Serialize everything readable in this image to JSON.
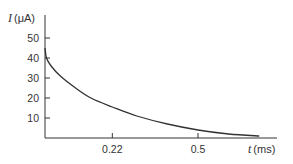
{
  "chart_data": {
    "type": "line",
    "title": "",
    "xlabel": "t (ms)",
    "ylabel": "I (μA)",
    "xlabel_var": "t",
    "xlabel_unit": "(ms)",
    "ylabel_var": "I",
    "ylabel_unit": "(μA)",
    "xlim": [
      0,
      0.72
    ],
    "ylim": [
      0,
      60
    ],
    "x_ticks": [
      0.22,
      0.5
    ],
    "x_tick_labels": [
      "0.22",
      "0.5"
    ],
    "y_ticks": [
      10,
      20,
      30,
      40,
      50
    ],
    "y_tick_labels": [
      "10",
      "20",
      "30",
      "40",
      "50"
    ],
    "grid": false,
    "legend": null,
    "series": [
      {
        "name": "I(t)",
        "color": "#333333",
        "x": [
          0.0,
          0.005,
          0.02,
          0.05,
          0.1,
          0.15,
          0.22,
          0.3,
          0.4,
          0.5,
          0.6,
          0.7
        ],
        "y": [
          45,
          40,
          36,
          31,
          25,
          20,
          15.5,
          11,
          7,
          4,
          2,
          1
        ]
      }
    ]
  }
}
